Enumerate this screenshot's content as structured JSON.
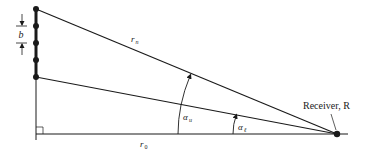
{
  "diagram": {
    "type": "geometry",
    "labels": {
      "spacing": "b",
      "top_ray": "r",
      "top_ray_sub": "n",
      "baseline": "r",
      "baseline_sub": "0",
      "angle_upper": "α",
      "angle_upper_sub": "u",
      "angle_lower": "α",
      "angle_lower_sub": "ℓ",
      "receiver": "Receiver, R"
    },
    "colors": {
      "ink": "#1a1a1a",
      "background": "#ffffff"
    },
    "array": {
      "x": 36,
      "top_y": 9,
      "bottom_y": 77,
      "dots_y": [
        9,
        26,
        43,
        60,
        77
      ]
    },
    "receiver_point": {
      "x": 337,
      "y": 134
    },
    "baseline_y": 134
  }
}
